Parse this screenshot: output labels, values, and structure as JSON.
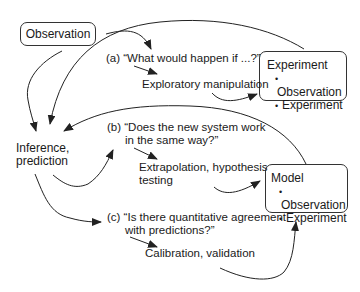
{
  "nodes": {
    "observation": {
      "label": "Observation"
    },
    "experiment": {
      "title": "Experiment",
      "items": [
        "Observation",
        "Experiment"
      ]
    },
    "model": {
      "title": "Model",
      "items": [
        "Observation",
        "Experiment"
      ]
    },
    "inference": {
      "line1": "Inference,",
      "line2": "prediction"
    }
  },
  "questions": {
    "a": {
      "line1": "(a) “What would happen if ...?”",
      "outcome": "Exploratory manipulation"
    },
    "b": {
      "line1": "(b) “Does the new system work",
      "line2": "in the same way?”",
      "outcome_line1": "Extrapolation, hypothesis",
      "outcome_line2": "testing"
    },
    "c": {
      "line1": "(c) “Is there quantitative agreement",
      "line2": "with predictions?”",
      "outcome": "Calibration, validation"
    }
  },
  "colors": {
    "stroke": "#222222",
    "text": "#1a1a1a",
    "background": "#ffffff"
  }
}
